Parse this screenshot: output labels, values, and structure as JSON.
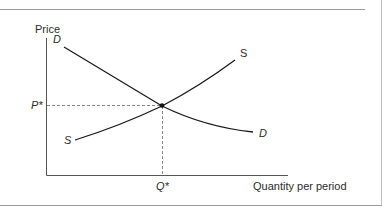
{
  "diagram": {
    "type": "supply-demand",
    "axes": {
      "y_label": "Price",
      "x_label": "Quantity per period"
    },
    "equilibrium": {
      "price_label": "P*",
      "quantity_label": "Q*"
    },
    "curves": {
      "demand": {
        "label_start": "D",
        "label_end": "D"
      },
      "supply": {
        "label_start": "S",
        "label_end": "S"
      }
    },
    "colors": {
      "line": "#1a1a1a",
      "axis": "#555555",
      "guide": "#777777",
      "frame": "#9a9a9a",
      "text": "#2b2b2b"
    }
  }
}
